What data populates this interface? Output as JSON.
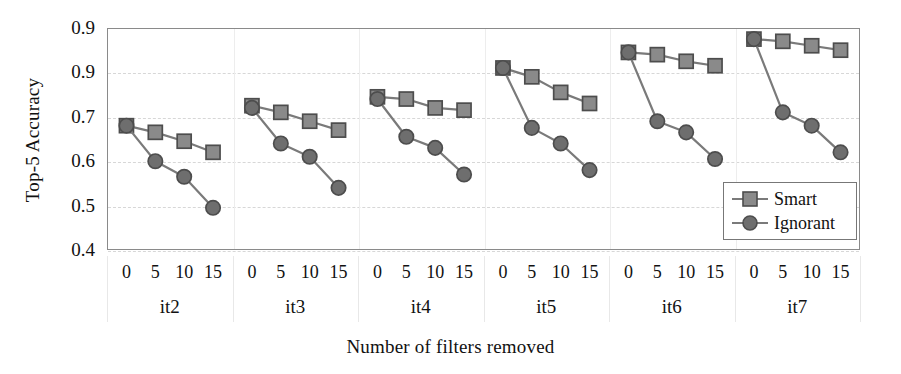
{
  "chart_data": {
    "type": "line",
    "title": "",
    "xlabel": "Number of filters removed",
    "ylabel": "Top-5 Accuracy",
    "ylim": [
      0.4,
      0.9
    ],
    "yticks": [
      "0.9",
      "0.9",
      "0.7",
      "0.6",
      "0.5",
      "0.4"
    ],
    "ytick_values": [
      0.9,
      0.8,
      0.7,
      0.6,
      0.5,
      0.4
    ],
    "grid": true,
    "legend_position": "bottom-right",
    "x": [
      0,
      5,
      10,
      15
    ],
    "xtick_labels": [
      "0",
      "5",
      "10",
      "15"
    ],
    "groups": [
      "it2",
      "it3",
      "it4",
      "it5",
      "it6",
      "it7"
    ],
    "legend": [
      "Smart",
      "Ignorant"
    ],
    "series": [
      {
        "name": "Smart",
        "marker": "square",
        "color": "#8a8a8a",
        "groups": [
          {
            "group": "it2",
            "values": [
              0.68,
              0.665,
              0.645,
              0.62
            ]
          },
          {
            "group": "it3",
            "values": [
              0.725,
              0.71,
              0.69,
              0.67
            ]
          },
          {
            "group": "it4",
            "values": [
              0.745,
              0.74,
              0.72,
              0.715
            ]
          },
          {
            "group": "it5",
            "values": [
              0.81,
              0.79,
              0.755,
              0.73
            ]
          },
          {
            "group": "it6",
            "values": [
              0.845,
              0.84,
              0.825,
              0.815
            ]
          },
          {
            "group": "it7",
            "values": [
              0.875,
              0.87,
              0.86,
              0.85
            ]
          }
        ]
      },
      {
        "name": "Ignorant",
        "marker": "circle",
        "color": "#6e6e6e",
        "groups": [
          {
            "group": "it2",
            "values": [
              0.68,
              0.6,
              0.565,
              0.495
            ]
          },
          {
            "group": "it3",
            "values": [
              0.72,
              0.64,
              0.61,
              0.54
            ]
          },
          {
            "group": "it4",
            "values": [
              0.74,
              0.655,
              0.63,
              0.57
            ]
          },
          {
            "group": "it5",
            "values": [
              0.81,
              0.675,
              0.64,
              0.58
            ]
          },
          {
            "group": "it6",
            "values": [
              0.845,
              0.69,
              0.665,
              0.605
            ]
          },
          {
            "group": "it7",
            "values": [
              0.875,
              0.71,
              0.68,
              0.62
            ]
          }
        ]
      }
    ]
  },
  "axes": {
    "ylabel": "Top-5 Accuracy",
    "xlabel": "Number of filters removed"
  },
  "legend": {
    "items": [
      {
        "label": "Smart",
        "marker": "square"
      },
      {
        "label": "Ignorant",
        "marker": "circle"
      }
    ]
  },
  "colors": {
    "smart_marker": "#8a8a8a",
    "ignorant_marker": "#6e6e6e",
    "line": "#7a7a7a",
    "marker_edge": "#4d4d4d",
    "frame": "#8a8a8a",
    "grid": "#d7d7d7",
    "text": "#111111"
  }
}
